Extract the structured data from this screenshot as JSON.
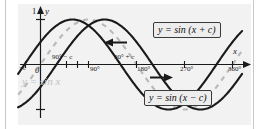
{
  "figure": {
    "kind": "trigonometric-graph",
    "background": "#f2f2f2",
    "curve_color": "#1a1a1a",
    "reference_curve_color": "#b9b9b9"
  },
  "axes": {
    "x_axis_label": "x",
    "y_axis_label": "y",
    "y_top_label": "1",
    "origin_label": "0",
    "x_ticks": [
      {
        "label": "−c",
        "x_value": -30
      },
      {
        "label": "90° − c",
        "x_value": 60
      },
      {
        "label": "90°",
        "x_value": 90
      },
      {
        "label": "90° + c",
        "x_value": 120
      },
      {
        "label": "180°",
        "x_value": 180
      },
      {
        "label": "270°",
        "x_value": 270
      },
      {
        "label": "360°",
        "x_value": 360
      }
    ]
  },
  "callouts": [
    {
      "name": "shift-left-label",
      "text": "y = sin (x + c)"
    },
    {
      "name": "shift-right-label",
      "text": "y = sin (x − c)"
    }
  ],
  "annotations": {
    "base_curve_label": "y = sin x",
    "left_arrow_name": "translate-left-arrow",
    "right_arrow_name": "translate-right-arrow"
  },
  "chart_data": {
    "type": "line",
    "title": "",
    "xlabel": "x",
    "ylabel": "y",
    "xlim": [
      -40,
      375
    ],
    "ylim": [
      -1.25,
      1.25
    ],
    "grid": false,
    "legend": "callout-boxes",
    "phase_shift_degrees": 30,
    "series": [
      {
        "name": "y = sin x",
        "style": "dashed",
        "color": "#b9b9b9",
        "amplitude": 1,
        "phase_deg": 0
      },
      {
        "name": "y = sin (x + c)",
        "style": "solid",
        "color": "#1a1a1a",
        "amplitude": 1,
        "phase_deg": 30
      },
      {
        "name": "y = sin (x − c)",
        "style": "solid",
        "color": "#1a1a1a",
        "amplitude": 1,
        "phase_deg": -30
      }
    ]
  }
}
